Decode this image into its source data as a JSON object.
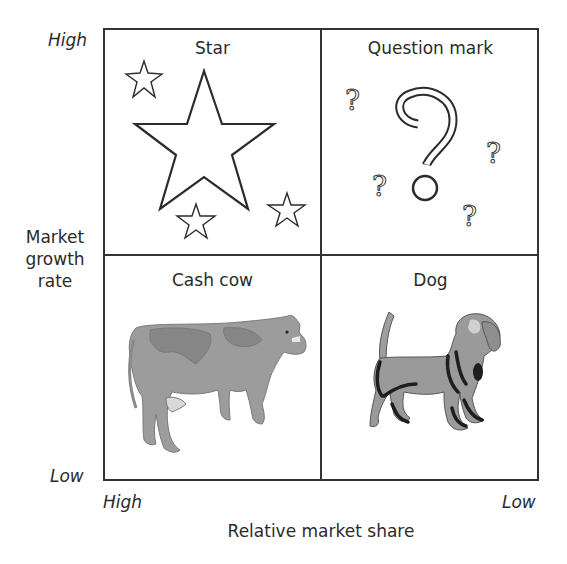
{
  "diagram": {
    "type": "BCG growth-share matrix",
    "quadrants": [
      {
        "position": "top-left",
        "label": "Star",
        "icon": "star-icon",
        "illustration": "one large outlined star with three small outlined stars"
      },
      {
        "position": "top-right",
        "label": "Question mark",
        "icon": "question-mark-icon",
        "illustration": "one large outlined question mark with four small question marks"
      },
      {
        "position": "bottom-left",
        "label": "Cash cow",
        "icon": "cow-icon",
        "illustration": "grayscale dairy cow"
      },
      {
        "position": "bottom-right",
        "label": "Dog",
        "icon": "dog-icon",
        "illustration": "grayscale beagle dog"
      }
    ],
    "y_axis": {
      "label_lines": [
        "Market",
        "growth",
        "rate"
      ],
      "high": "High",
      "low": "Low"
    },
    "x_axis": {
      "label": "Relative market share",
      "high": "High",
      "low": "Low"
    },
    "colors": {
      "line": "#333333",
      "text": "#2b2b2b",
      "animal_fill": "#9a9a9a",
      "animal_dark": "#1e1e1e",
      "background": "#ffffff"
    }
  }
}
